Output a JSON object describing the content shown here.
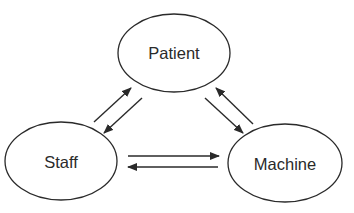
{
  "diagram": {
    "type": "relationship-triangle",
    "nodes": [
      {
        "id": "patient",
        "label": "Patient",
        "cx": 174,
        "cy": 53,
        "rx": 56,
        "ry": 39,
        "label_y": 59
      },
      {
        "id": "staff",
        "label": "Staff",
        "cx": 61,
        "cy": 161,
        "rx": 56,
        "ry": 39,
        "label_y": 168
      },
      {
        "id": "machine",
        "label": "Machine",
        "cx": 285,
        "cy": 163,
        "rx": 57,
        "ry": 39,
        "label_y": 170
      }
    ],
    "edges": [
      {
        "from": "staff",
        "to": "patient",
        "x1": 94,
        "y1": 122,
        "x2": 131,
        "y2": 88
      },
      {
        "from": "patient",
        "to": "staff",
        "x1": 142,
        "y1": 98,
        "x2": 104,
        "y2": 133
      },
      {
        "from": "patient",
        "to": "machine",
        "x1": 205,
        "y1": 98,
        "x2": 243,
        "y2": 133
      },
      {
        "from": "machine",
        "to": "patient",
        "x1": 253,
        "y1": 124,
        "x2": 216,
        "y2": 88
      },
      {
        "from": "staff",
        "to": "machine",
        "x1": 128,
        "y1": 156,
        "x2": 219,
        "y2": 156
      },
      {
        "from": "machine",
        "to": "staff",
        "x1": 218,
        "y1": 167,
        "x2": 128,
        "y2": 167
      }
    ],
    "colors": {
      "stroke": "#2a2a2a",
      "background": "#ffffff"
    }
  }
}
